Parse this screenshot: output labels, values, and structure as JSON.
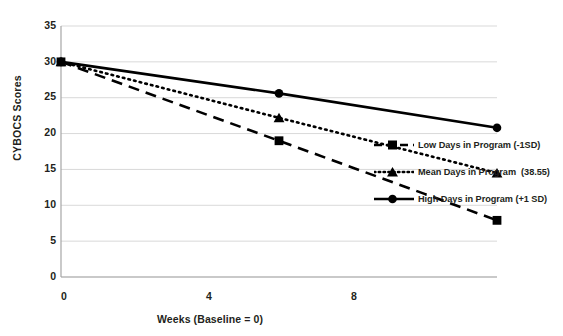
{
  "chart_data": {
    "type": "line",
    "title": "",
    "xlabel": "Weeks (Baseline = 0)",
    "ylabel": "CYBOCS Scores",
    "x": [
      0,
      4,
      8
    ],
    "xlim": [
      0,
      8
    ],
    "ylim": [
      0,
      35
    ],
    "xticks": [
      "0",
      "4",
      "8"
    ],
    "yticks": [
      "0",
      "5",
      "10",
      "15",
      "20",
      "25",
      "30",
      "35"
    ],
    "grid": true,
    "legend_position": "right",
    "series": [
      {
        "name": "Low Days in Program (-1SD)",
        "values": [
          30.0,
          19.0,
          7.9
        ],
        "line_style": "dashed",
        "marker": "square",
        "color": "#000000"
      },
      {
        "name": "Mean Days in Program  (38.55)",
        "values": [
          30.0,
          22.2,
          14.5
        ],
        "line_style": "dotted",
        "marker": "triangle",
        "color": "#000000"
      },
      {
        "name": "High Days in Program (+1 SD)",
        "values": [
          30.0,
          25.6,
          20.8
        ],
        "line_style": "solid",
        "marker": "circle",
        "color": "#000000"
      }
    ]
  },
  "axes": {
    "y_title": "CYBOCS Scores",
    "x_title": "Weeks (Baseline = 0)",
    "y_ticks": [
      "35",
      "30",
      "25",
      "20",
      "15",
      "10",
      "5",
      "0"
    ],
    "x_ticks": [
      "0",
      "4",
      "8"
    ]
  },
  "legend": {
    "entries": [
      {
        "label": "Low Days in Program (-1SD)"
      },
      {
        "label": "Mean Days in Program  (38.55)"
      },
      {
        "label": "High Days in Program (+1 SD)"
      }
    ]
  },
  "colors": {
    "ink": "#231f20",
    "grid": "#d9d9d9",
    "axis": "#a6a6a6",
    "series": "#000000"
  }
}
